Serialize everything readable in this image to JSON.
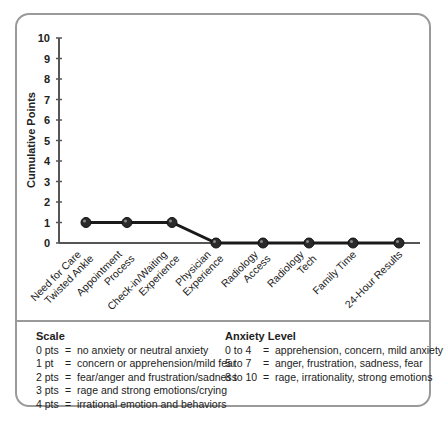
{
  "chart_data": {
    "type": "line",
    "title": "",
    "xlabel": "",
    "ylabel": "Cumulative Points",
    "ylim": [
      0,
      10
    ],
    "yticks": [
      0,
      1,
      2,
      3,
      4,
      5,
      6,
      7,
      8,
      9,
      10
    ],
    "grid": false,
    "categories": [
      "Need for Care Twisted Ankle",
      "Appointment Process",
      "Check-in/Waiting Experience",
      "Physician Experience",
      "Radiology Access",
      "Radiology Tech",
      "Family Time",
      "24-Hour Results"
    ],
    "category_lines": [
      [
        "Need for Care",
        "Twisted Ankle"
      ],
      [
        "Appointment",
        "Process"
      ],
      [
        "Check-in/Waiting",
        "Experience"
      ],
      [
        "Physician",
        "Experience"
      ],
      [
        "Radiology",
        "Access"
      ],
      [
        "Radiology",
        "Tech"
      ],
      [
        "Family Time"
      ],
      [
        "24-Hour Results"
      ]
    ],
    "series": [
      {
        "name": "Cumulative Points",
        "values": [
          1,
          1,
          1,
          0,
          0,
          0,
          0,
          0
        ]
      }
    ],
    "line_color": "#1a1a1a",
    "marker_color": "#2a2a2a"
  },
  "legend": {
    "scale": {
      "title": "Scale",
      "rows": [
        {
          "key": "0 pts",
          "eq": "=",
          "desc": "no anxiety or neutral anxiety"
        },
        {
          "key": "1 pt",
          "eq": "=",
          "desc": "concern or apprehension/mild fear"
        },
        {
          "key": "2 pts",
          "eq": "=",
          "desc": "fear/anger and frustration/sadness"
        },
        {
          "key": "3 pts",
          "eq": "=",
          "desc": "rage and strong emotions/crying"
        },
        {
          "key": "4 pts",
          "eq": "=",
          "desc": "irrational emotion and behaviors"
        }
      ]
    },
    "anxiety_level": {
      "title": "Anxiety Level",
      "rows": [
        {
          "key": "0 to 4",
          "eq": "=",
          "desc": "apprehension, concern, mild anxiety"
        },
        {
          "key": "5 to 7",
          "eq": "=",
          "desc": "anger, frustration, sadness, fear"
        },
        {
          "key": "8 to 10",
          "eq": "=",
          "desc": "rage, irrationality, strong emotions"
        }
      ]
    }
  }
}
